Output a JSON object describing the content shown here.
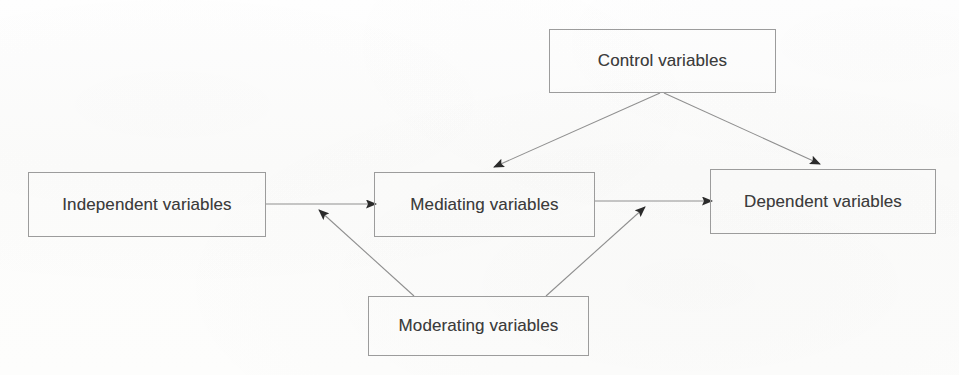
{
  "diagram": {
    "background_color": "#fdfdfd",
    "line_color": "#8f8f8f",
    "text_color": "#3c3c3c",
    "nodes": [
      {
        "id": "control",
        "label": "Control variables"
      },
      {
        "id": "independent",
        "label": "Independent variables"
      },
      {
        "id": "mediating",
        "label": "Mediating variables"
      },
      {
        "id": "dependent",
        "label": "Dependent variables"
      },
      {
        "id": "moderating",
        "label": "Moderating variables"
      }
    ],
    "edges": [
      {
        "id": "control-to-mediating",
        "from": "control",
        "to": "mediating",
        "style": "arrow"
      },
      {
        "id": "control-to-dependent",
        "from": "control",
        "to": "dependent",
        "style": "arrow"
      },
      {
        "id": "independent-to-mediating",
        "from": "independent",
        "to": "mediating",
        "style": "arrow"
      },
      {
        "id": "mediating-to-dependent",
        "from": "mediating",
        "to": "dependent",
        "style": "arrow"
      },
      {
        "id": "moderating-to-left-path",
        "from": "moderating",
        "to": "independent-mediating-path",
        "style": "arrow"
      },
      {
        "id": "moderating-to-right-path",
        "from": "moderating",
        "to": "mediating-dependent-path",
        "style": "arrow"
      }
    ]
  }
}
